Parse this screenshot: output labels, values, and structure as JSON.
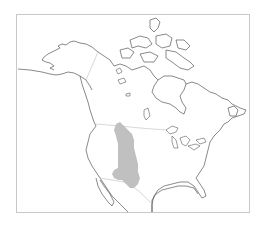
{
  "map": {
    "title": "",
    "region": "North America",
    "frame_color": "#c8c8c8",
    "coastline_color": "#3a3a3a",
    "border_color": "#bdbdbd",
    "range": {
      "label": "",
      "fill_color": "#c0c0c0"
    }
  }
}
